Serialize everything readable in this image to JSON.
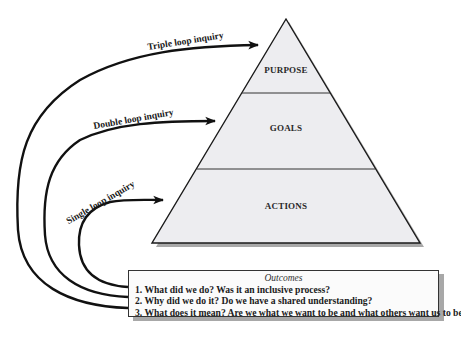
{
  "pyramid": {
    "layers": [
      {
        "label": "PURPOSE"
      },
      {
        "label": "GOALS"
      },
      {
        "label": "ACTIONS"
      }
    ],
    "fill_color": "#ededf0",
    "shadow_color": "#a9a9a9"
  },
  "loops": [
    {
      "label": "Triple loop inquiry"
    },
    {
      "label": "Double loop inquiry"
    },
    {
      "label": "Single loop inquiry"
    }
  ],
  "outcomes": {
    "title": "Outcomes",
    "items": [
      "1. What did we do?  Was it an inclusive process?",
      "2. Why did we do it?  Do we have a shared understanding?",
      "3. What does it mean?  Are we what we want to be and what others want us to be?"
    ]
  }
}
